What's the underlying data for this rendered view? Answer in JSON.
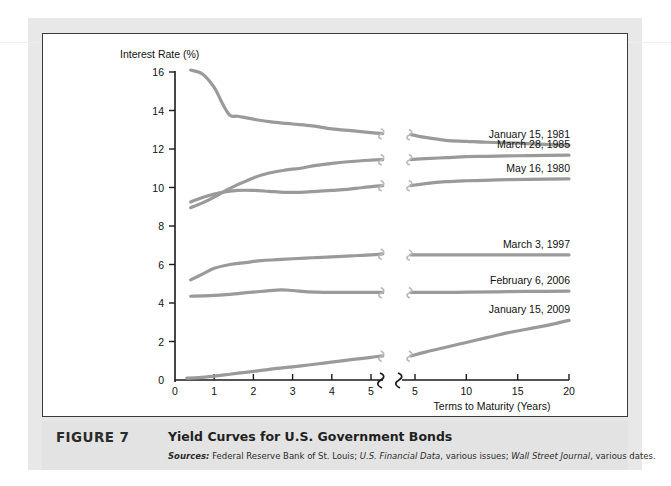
{
  "figure": {
    "number_label": "FIGURE 7",
    "title": "Yield Curves for U.S. Government Bonds",
    "sources_prefix": "Sources:",
    "sources_part1": " Federal Reserve Bank of St. Louis; ",
    "sources_italic1": "U.S. Financial Data",
    "sources_part2": ", various issues; ",
    "sources_italic2": "Wall Street Journal",
    "sources_part3": ", various dates."
  },
  "colors": {
    "curve": "#9a9a9a",
    "axis": "#1a1a1a",
    "caption_band": "#e3e3e3",
    "figure_border": "#3a3a3a",
    "text": "#111111"
  },
  "chart_data": {
    "type": "line",
    "title": "Yield Curves for U.S. Government Bonds",
    "xlabel": "Terms to Maturity (Years)",
    "ylabel": "Interest Rate (%)",
    "ylim": [
      0,
      16
    ],
    "ytick_labels": [
      "0",
      "2",
      "4",
      "6",
      "8",
      "10",
      "12",
      "14",
      "16"
    ],
    "yticks": [
      0,
      2,
      4,
      6,
      8,
      10,
      12,
      14,
      16
    ],
    "grid": false,
    "legend_position": "inline-right-of-curve",
    "axis_break": true,
    "left_panel": {
      "xlim": [
        0,
        5.5
      ],
      "xticks": [
        0,
        1,
        2,
        3,
        4,
        5
      ],
      "xtick_labels": [
        "0",
        "1",
        "2",
        "3",
        "4",
        "5"
      ]
    },
    "right_panel": {
      "xlim": [
        4,
        21
      ],
      "xticks": [
        5,
        10,
        15,
        20
      ],
      "xtick_labels": [
        "5",
        "10",
        "15",
        "20"
      ]
    },
    "series": [
      {
        "name": "January 15, 1981",
        "label": "January 15, 1981",
        "left_x": [
          0.4,
          0.7,
          1.0,
          1.2,
          1.4,
          1.6,
          2.0,
          2.5,
          3.0,
          3.5,
          4.0,
          4.5,
          5.0,
          5.3
        ],
        "left_y": [
          16.1,
          15.9,
          15.2,
          14.4,
          13.75,
          13.7,
          13.55,
          13.4,
          13.3,
          13.2,
          13.05,
          12.95,
          12.85,
          12.8
        ],
        "right_x": [
          4.6,
          6.0,
          8.0,
          10.0,
          12.0,
          15.0,
          17.0,
          20.0
        ],
        "right_y": [
          12.75,
          12.6,
          12.45,
          12.4,
          12.35,
          12.3,
          12.25,
          12.2
        ]
      },
      {
        "name": "March 28, 1985",
        "label": "March 28, 1985",
        "left_x": [
          0.4,
          0.7,
          1.0,
          1.3,
          1.6,
          2.0,
          2.4,
          2.8,
          3.2,
          3.6,
          4.0,
          4.5,
          5.0,
          5.3
        ],
        "left_y": [
          8.95,
          9.2,
          9.5,
          9.85,
          10.15,
          10.5,
          10.75,
          10.9,
          11.0,
          11.15,
          11.25,
          11.35,
          11.42,
          11.45
        ],
        "right_x": [
          4.6,
          6.0,
          8.0,
          10.0,
          12.0,
          15.0,
          18.0,
          20.0
        ],
        "right_y": [
          11.45,
          11.5,
          11.55,
          11.6,
          11.62,
          11.65,
          11.67,
          11.68
        ]
      },
      {
        "name": "May 16, 1980",
        "label": "May 16, 1980",
        "left_x": [
          0.4,
          0.8,
          1.2,
          1.6,
          2.0,
          2.4,
          2.8,
          3.2,
          3.6,
          4.0,
          4.4,
          4.8,
          5.3
        ],
        "left_y": [
          9.25,
          9.55,
          9.75,
          9.85,
          9.85,
          9.8,
          9.75,
          9.75,
          9.8,
          9.85,
          9.9,
          10.0,
          10.1
        ],
        "right_x": [
          4.6,
          6.0,
          8.0,
          10.0,
          13.0,
          16.0,
          20.0
        ],
        "right_y": [
          10.1,
          10.2,
          10.3,
          10.35,
          10.4,
          10.42,
          10.45
        ]
      },
      {
        "name": "March 3, 1997",
        "label": "March 3, 1997",
        "left_x": [
          0.4,
          0.7,
          1.0,
          1.4,
          1.8,
          2.2,
          2.6,
          3.0,
          3.5,
          4.0,
          4.5,
          5.0,
          5.3
        ],
        "left_y": [
          5.2,
          5.5,
          5.8,
          6.0,
          6.1,
          6.2,
          6.25,
          6.3,
          6.35,
          6.4,
          6.45,
          6.5,
          6.55
        ],
        "right_x": [
          4.6,
          7.0,
          10.0,
          13.0,
          16.0,
          20.0
        ],
        "right_y": [
          6.5,
          6.5,
          6.5,
          6.5,
          6.5,
          6.5
        ]
      },
      {
        "name": "February 6, 2006",
        "label": "February 6, 2006",
        "left_x": [
          0.4,
          0.9,
          1.4,
          1.9,
          2.3,
          2.7,
          3.0,
          3.4,
          3.8,
          4.3,
          4.8,
          5.3
        ],
        "left_y": [
          4.35,
          4.38,
          4.45,
          4.55,
          4.62,
          4.68,
          4.65,
          4.58,
          4.55,
          4.55,
          4.55,
          4.55
        ],
        "right_x": [
          4.6,
          7.0,
          10.0,
          13.0,
          16.0,
          20.0
        ],
        "right_y": [
          4.55,
          4.55,
          4.56,
          4.58,
          4.6,
          4.62
        ]
      },
      {
        "name": "January 15, 2009",
        "label": "January 15, 2009",
        "left_x": [
          0.3,
          0.6,
          1.0,
          1.4,
          1.8,
          2.2,
          2.6,
          3.0,
          3.4,
          3.8,
          4.2,
          4.6,
          5.0,
          5.3
        ],
        "left_y": [
          0.1,
          0.12,
          0.2,
          0.3,
          0.4,
          0.5,
          0.6,
          0.68,
          0.78,
          0.88,
          0.98,
          1.08,
          1.18,
          1.25
        ],
        "right_x": [
          4.6,
          6.0,
          8.0,
          10.0,
          12.0,
          14.0,
          16.0,
          18.0,
          20.0
        ],
        "right_y": [
          1.25,
          1.45,
          1.7,
          1.95,
          2.2,
          2.45,
          2.65,
          2.85,
          3.1
        ]
      }
    ]
  }
}
